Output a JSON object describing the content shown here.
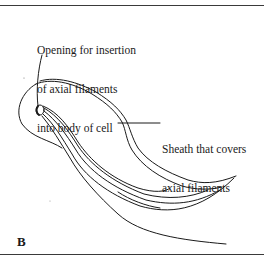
{
  "figure": {
    "panel_label": "B",
    "labels": {
      "opening": [
        "Opening for insertion",
        "of axial filaments",
        "into body of cell"
      ],
      "sheath": [
        "Sheath that covers",
        "axial filaments"
      ]
    },
    "colors": {
      "ink": "#1a1a1a",
      "background": "#ffffff",
      "border": "#3a3a3a"
    }
  }
}
